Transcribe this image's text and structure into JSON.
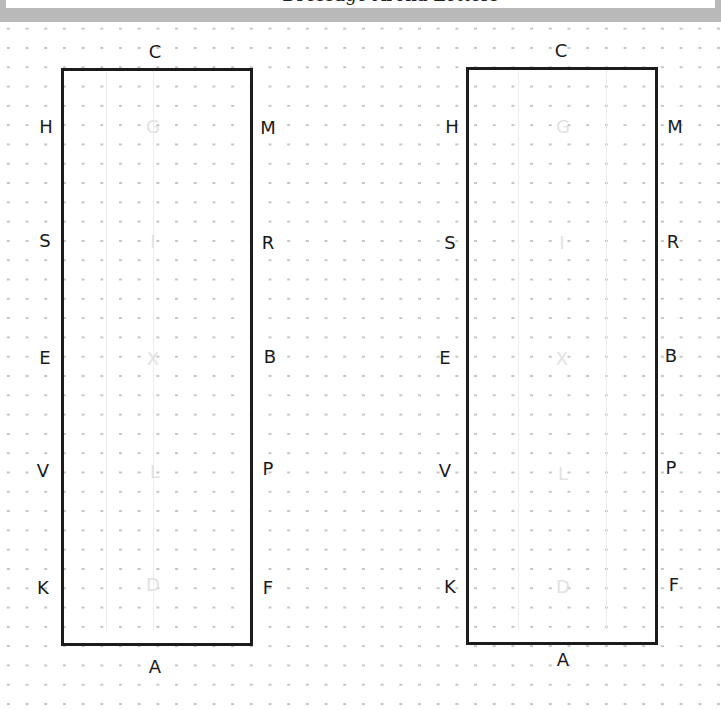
{
  "header": {
    "title": "Dressage Arena Letters",
    "border_color": "#b9b9b9"
  },
  "diagram": {
    "background": "dot-grid",
    "arenas": [
      {
        "id": "left",
        "top_letter": "C",
        "bottom_letter": "A",
        "left_letters": [
          "H",
          "S",
          "E",
          "V",
          "K"
        ],
        "right_letters": [
          "M",
          "R",
          "B",
          "P",
          "F"
        ],
        "center_letters": [
          "G",
          "I",
          "X",
          "L",
          "D"
        ]
      },
      {
        "id": "right",
        "top_letter": "C",
        "bottom_letter": "A",
        "left_letters": [
          "H",
          "S",
          "E",
          "V",
          "K"
        ],
        "right_letters": [
          "M",
          "R",
          "B",
          "P",
          "F"
        ],
        "center_letters": [
          "G",
          "I",
          "X",
          "L",
          "D"
        ]
      }
    ]
  }
}
